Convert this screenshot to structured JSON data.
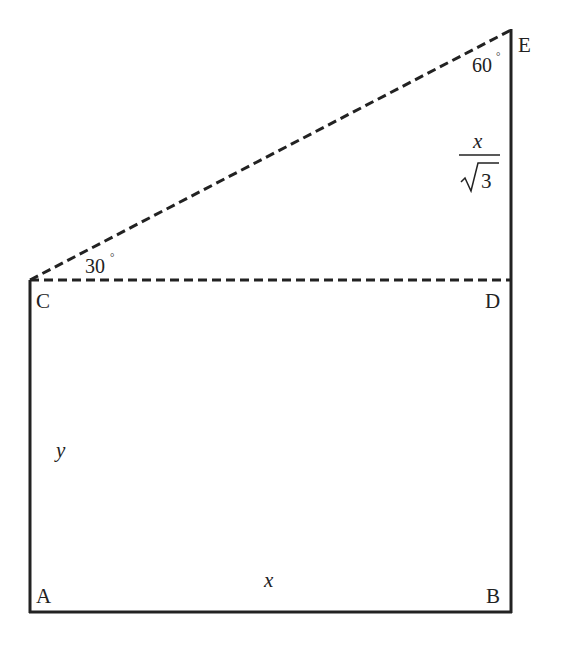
{
  "diagram": {
    "vertices": {
      "A": {
        "label": "A",
        "x": 30,
        "y": 612
      },
      "B": {
        "label": "B",
        "x": 511,
        "y": 612
      },
      "C": {
        "label": "C",
        "x": 30,
        "y": 280
      },
      "D": {
        "label": "D",
        "x": 511,
        "y": 280
      },
      "E": {
        "label": "E",
        "x": 511,
        "y": 30
      }
    },
    "labels": {
      "side_AB": "x",
      "side_AC": "y",
      "side_DE_numerator": "x",
      "side_DE_radical": "3",
      "angle_C": "30",
      "angle_E": "60",
      "degree_symbol": "°"
    },
    "colors": {
      "stroke": "#222222",
      "background": "#ffffff"
    }
  }
}
